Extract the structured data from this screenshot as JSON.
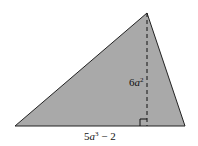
{
  "diagram": {
    "shape": "triangle",
    "fill_color": "#a9a9a9",
    "stroke_color": "#222222",
    "vertices": {
      "left": [
        15,
        126
      ],
      "apex": [
        147,
        13
      ],
      "right": [
        185,
        126
      ]
    },
    "height": {
      "label_coef": "6",
      "label_var": "a",
      "label_exp": "2",
      "style": "dashed"
    },
    "base": {
      "label_coef": "5",
      "label_var": "a",
      "label_exp": "3",
      "label_rest": " − 2"
    },
    "right_angle_marker": true
  }
}
